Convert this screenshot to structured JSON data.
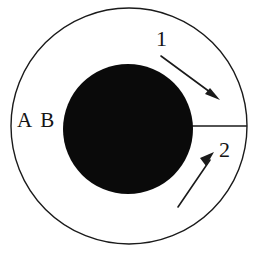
{
  "figure": {
    "type": "schematic-diagram",
    "background_color": "#ffffff",
    "stroke_color": "#1a1a1a",
    "fill_color": "#0a0a0a",
    "outer_circle": {
      "name": "outer-boundary-circle",
      "center_x": 129,
      "center_y": 126,
      "radius": 118,
      "fill": "none",
      "stroke": "#1a1a1a",
      "stroke_width": 1.4
    },
    "inner_circle": {
      "name": "inner-filled-circle",
      "center_x": 128,
      "center_y": 129,
      "radius": 65,
      "fill": "#0a0a0a",
      "stroke": "none"
    },
    "radial_line": {
      "name": "radial-connector-line",
      "x1": 193,
      "y1": 126,
      "x2": 247,
      "y2": 126,
      "stroke": "#1a1a1a",
      "stroke_width": 1.4
    },
    "arrows": [
      {
        "id": "arrow-1",
        "label": "1",
        "direction": "down-right",
        "x1": 161,
        "y1": 56,
        "x2": 219,
        "y2": 99,
        "stroke": "#1a1a1a",
        "stroke_width": 1.6
      },
      {
        "id": "arrow-2",
        "label": "2",
        "direction": "up-right",
        "x1": 178,
        "y1": 207,
        "x2": 214,
        "y2": 153,
        "stroke": "#1a1a1a",
        "stroke_width": 1.6
      }
    ],
    "labels": {
      "ab": "A B",
      "one": "1",
      "two": "2"
    }
  }
}
